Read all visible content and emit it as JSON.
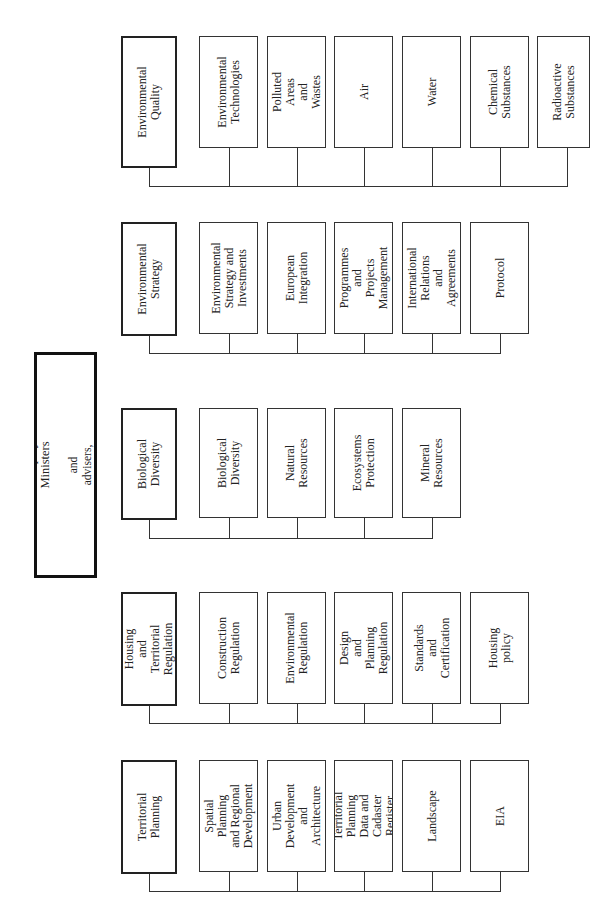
{
  "minister": {
    "line1": "Minister",
    "line2": "5 Deputy Ministers",
    "line3": "and advisers, secretariat, common services"
  },
  "departments": [
    {
      "head": "Environmental\nQuality",
      "units": [
        "Environmental\nTechnologies",
        "Polluted Areas and\nWastes",
        "Air",
        "Water",
        "Chemical\nSubstances",
        "Radioactive\nSubstances"
      ]
    },
    {
      "head": "Environmental\nStrategy",
      "units": [
        "Environmental\nStrategy and\nInvestments",
        "European\nIntegration",
        "Programmes and\nProjects\nManagement",
        "International\nRelations and\nAgreements",
        "Protocol"
      ]
    },
    {
      "head": "Biological\nDiversity",
      "units": [
        "Biological\nDiversity",
        "Natural Resources",
        "Ecosystems\nProtection",
        "Mineral\nResources"
      ]
    },
    {
      "head": "Housing and\nTerritorial\nRegulation",
      "units": [
        "Construction\nRegulation",
        "Environmental\nRegulation",
        "Design and\nPlanning\nRegulation",
        "Standards and\nCertification",
        "Housing policy"
      ]
    },
    {
      "head": "Territorial\nPlanning",
      "units": [
        "Spatial Planning\nand Regional\nDevelopment",
        "Urban\nDevelopment and\nArchitecture",
        "Territorial Planning\nData and Cadaster\nRegister",
        "Landscape",
        "EIA"
      ]
    }
  ]
}
